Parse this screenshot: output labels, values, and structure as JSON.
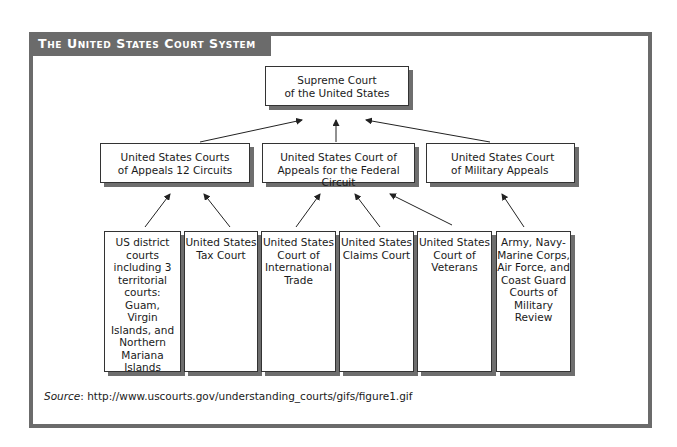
{
  "title": "The United States Court System",
  "supreme": {
    "line1": "Supreme Court",
    "line2": "of the United States"
  },
  "appeals": [
    {
      "line1": "United States Courts",
      "line2": "of Appeals 12 Circuits"
    },
    {
      "line1": "United States Court of",
      "line2": "Appeals for the Federal Circuit"
    },
    {
      "line1": "United States Court",
      "line2": "of Military Appeals"
    }
  ],
  "trial": [
    {
      "lines": [
        "US district",
        "courts",
        "including 3",
        "territorial",
        "courts:",
        "Guam,",
        "Virgin",
        "Islands, and",
        "Northern",
        "Mariana",
        "Islands"
      ]
    },
    {
      "lines": [
        "United States",
        "Tax Court"
      ]
    },
    {
      "lines": [
        "United States",
        "Court of",
        "International",
        "Trade"
      ]
    },
    {
      "lines": [
        "United States",
        "Claims Court"
      ]
    },
    {
      "lines": [
        "United States",
        "Court of",
        "Veterans"
      ]
    },
    {
      "lines": [
        "Army, Navy-",
        "Marine Corps,",
        "Air Force, and",
        "Coast Guard",
        "Courts of",
        "Military",
        "Review"
      ]
    }
  ],
  "source": {
    "label": "Source",
    "text": ": http://www.uscourts.gov/understanding_courts/gifs/figure1.gif"
  },
  "colors": {
    "frame": "#6b6b6b",
    "shadow": "#6e6e6e",
    "text": "#1a1a1a"
  }
}
